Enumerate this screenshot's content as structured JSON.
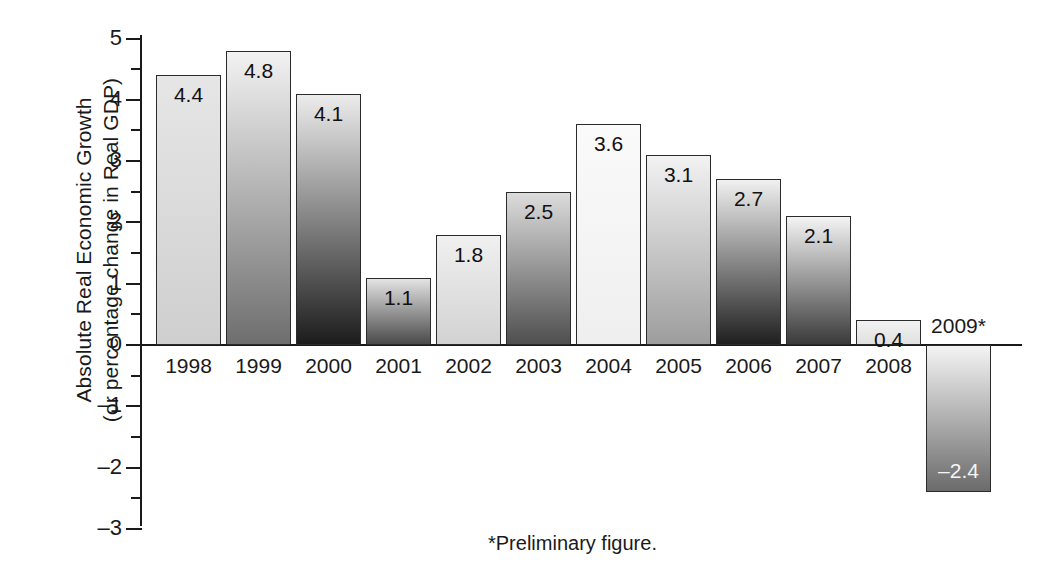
{
  "chart_data": {
    "type": "bar",
    "title": "",
    "xlabel": "",
    "ylabel_line1": "Absolute Real Economic Growth",
    "ylabel_line2": "(or percentage change in Real GDP)",
    "categories": [
      "1998",
      "1999",
      "2000",
      "2001",
      "2002",
      "2003",
      "2004",
      "2005",
      "2006",
      "2007",
      "2008",
      "2009*"
    ],
    "values": [
      4.4,
      4.8,
      4.1,
      1.1,
      1.8,
      2.5,
      3.6,
      3.1,
      2.7,
      2.1,
      0.4,
      -2.4
    ],
    "value_labels": [
      "4.4",
      "4.8",
      "4.1",
      "1.1",
      "1.8",
      "2.5",
      "3.6",
      "3.1",
      "2.7",
      "2.1",
      "0.4",
      "–2.4"
    ],
    "ylim": [
      -3,
      5
    ],
    "yticks": [
      5,
      4,
      3,
      2,
      1,
      0,
      -1,
      -2,
      -3
    ],
    "ytick_labels": [
      "5",
      "4",
      "3",
      "2",
      "1",
      "0",
      "–1",
      "–2",
      "–3"
    ],
    "minor_ticks": [
      4.5,
      3.5,
      2.5,
      1.5,
      0.5,
      -0.5,
      -1.5,
      -2.5
    ],
    "grid": false,
    "legend": "none",
    "footnote": "*Preliminary figure.",
    "bar_fills": [
      {
        "top": "#e6e6e6",
        "bottom": "#cfcfcf"
      },
      {
        "top": "#f2f2f2",
        "bottom": "#6e6e6e"
      },
      {
        "top": "#ececec",
        "bottom": "#1c1c1c"
      },
      {
        "top": "#e3e3e3",
        "bottom": "#4a4a4a"
      },
      {
        "top": "#f0f0f0",
        "bottom": "#d2d2d2"
      },
      {
        "top": "#dcdcdc",
        "bottom": "#4f4f4f"
      },
      {
        "top": "#fafafa",
        "bottom": "#efefef"
      },
      {
        "top": "#f2f2f2",
        "bottom": "#9d9d9d"
      },
      {
        "top": "#f0f0f0",
        "bottom": "#1f1f1f"
      },
      {
        "top": "#f4f4f4",
        "bottom": "#3a3a3a"
      },
      {
        "top": "#f2f2f2",
        "bottom": "#e0e0e0"
      },
      {
        "top": "#f4f4f4",
        "bottom": "#6b6b6b"
      }
    ]
  }
}
